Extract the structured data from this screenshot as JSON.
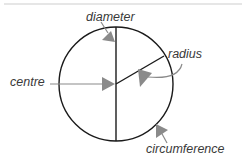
{
  "diagram": {
    "labels": {
      "diameter": "diameter",
      "radius": "radius",
      "centre": "centre",
      "circumference": "circumference"
    },
    "geometry": {
      "circle_center": [
        116,
        84
      ],
      "circle_radius": 57,
      "diameter_line": [
        [
          116,
          27
        ],
        [
          116,
          141
        ]
      ],
      "radius_line": [
        [
          116,
          84
        ],
        [
          164,
          56
        ]
      ]
    },
    "colors": {
      "outline": "#1a1a1a",
      "arrow": "#8a8a8a",
      "label_text": "#3a3a3a",
      "background": "#ffffff"
    }
  }
}
